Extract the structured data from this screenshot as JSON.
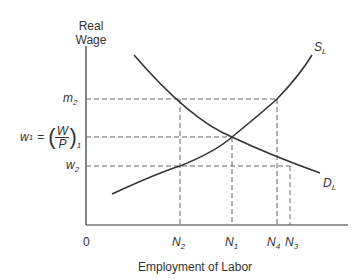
{
  "diagram": {
    "y_axis_label_line1": "Real",
    "y_axis_label_line2": "Wage",
    "x_axis_label": "Employment of Labor",
    "origin_label": "0",
    "y_ticks": {
      "m2": {
        "base": "m",
        "sub": "2"
      },
      "w1": {
        "base": "w",
        "sub": "1",
        "eq": "=",
        "num": "W",
        "den": "P",
        "outer_sub": "1"
      },
      "w2": {
        "base": "w",
        "sub": "2"
      }
    },
    "x_ticks": [
      {
        "base": "N",
        "sub": "2"
      },
      {
        "base": "N",
        "sub": "1"
      },
      {
        "base": "N",
        "sub": "4"
      },
      {
        "base": "N",
        "sub": "3"
      }
    ],
    "curves": {
      "supply": {
        "base": "S",
        "sub": "L"
      },
      "demand": {
        "base": "D",
        "sub": "L"
      }
    },
    "colors": {
      "line": "#333333",
      "dash": "#555555"
    }
  }
}
